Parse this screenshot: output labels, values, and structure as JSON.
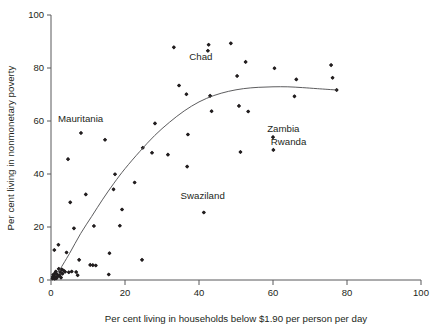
{
  "chart_data": {
    "type": "scatter",
    "title": "",
    "xlabel": "Per cent living in households below $1.90 per person per day",
    "ylabel": "Per cent living in nonmonetary poverty",
    "xlim": [
      0,
      100
    ],
    "ylim": [
      0,
      100
    ],
    "xticks": [
      0,
      20,
      40,
      60,
      80,
      100
    ],
    "yticks": [
      0,
      20,
      40,
      60,
      80,
      100
    ],
    "grid": false,
    "legend": "none",
    "marker_color": "#231f20",
    "curve_color": "#4a4a4c",
    "points": [
      [
        0.4,
        0.6
      ],
      [
        0.5,
        1.2
      ],
      [
        0.6,
        2.0
      ],
      [
        0.7,
        0.8
      ],
      [
        0.8,
        1.6
      ],
      [
        0.9,
        11.3
      ],
      [
        1.0,
        0.5
      ],
      [
        1.1,
        2.6
      ],
      [
        1.2,
        1.0
      ],
      [
        1.3,
        3.2
      ],
      [
        1.5,
        0.7
      ],
      [
        1.6,
        2.2
      ],
      [
        1.8,
        1.3
      ],
      [
        2.0,
        13.3
      ],
      [
        2.1,
        4.2
      ],
      [
        2.3,
        1.8
      ],
      [
        2.5,
        3.0
      ],
      [
        2.7,
        0.9
      ],
      [
        2.9,
        4.0
      ],
      [
        3.1,
        2.4
      ],
      [
        3.4,
        3.6
      ],
      [
        3.8,
        3.1
      ],
      [
        4.2,
        10.4
      ],
      [
        4.6,
        45.6
      ],
      [
        4.8,
        2.9
      ],
      [
        5.2,
        29.3
      ],
      [
        5.6,
        3.2
      ],
      [
        6.2,
        19.5
      ],
      [
        6.8,
        3.0
      ],
      [
        7.2,
        1.8
      ],
      [
        7.6,
        7.6
      ],
      [
        8.1,
        55.5
      ],
      [
        9.4,
        32.3
      ],
      [
        10.6,
        5.7
      ],
      [
        11.3,
        5.6
      ],
      [
        11.6,
        20.4
      ],
      [
        12.1,
        5.5
      ],
      [
        14.6,
        52.9
      ],
      [
        15.6,
        2.1
      ],
      [
        15.8,
        10.1
      ],
      [
        16.9,
        34.2
      ],
      [
        17.3,
        39.9
      ],
      [
        18.6,
        20.5
      ],
      [
        19.2,
        26.6
      ],
      [
        22.6,
        36.8
      ],
      [
        24.6,
        7.6
      ],
      [
        24.8,
        49.9
      ],
      [
        27.3,
        48.0
      ],
      [
        28.1,
        59.1
      ],
      [
        31.6,
        47.3
      ],
      [
        33.2,
        87.8
      ],
      [
        34.6,
        73.4
      ],
      [
        36.6,
        70.1
      ],
      [
        36.8,
        42.8
      ],
      [
        37.0,
        54.9
      ],
      [
        41.3,
        25.5
      ],
      [
        42.4,
        86.5
      ],
      [
        42.6,
        88.8
      ],
      [
        43.0,
        69.5
      ],
      [
        43.4,
        63.7
      ],
      [
        48.6,
        89.3
      ],
      [
        50.3,
        77.0
      ],
      [
        50.8,
        65.7
      ],
      [
        51.2,
        48.3
      ],
      [
        52.6,
        82.3
      ],
      [
        53.3,
        63.6
      ],
      [
        60.0,
        53.9
      ],
      [
        60.1,
        49.1
      ],
      [
        60.4,
        79.9
      ],
      [
        65.8,
        69.3
      ],
      [
        66.3,
        75.7
      ],
      [
        75.7,
        81.1
      ],
      [
        76.1,
        76.3
      ],
      [
        77.2,
        71.7
      ]
    ],
    "trend_curve": [
      [
        2.0,
        3.0
      ],
      [
        5.0,
        10.0
      ],
      [
        8.0,
        17.5
      ],
      [
        11.0,
        24.0
      ],
      [
        14.0,
        30.5
      ],
      [
        17.0,
        36.5
      ],
      [
        20.0,
        42.0
      ],
      [
        24.0,
        48.5
      ],
      [
        28.0,
        54.5
      ],
      [
        32.0,
        59.5
      ],
      [
        36.0,
        63.8
      ],
      [
        40.0,
        67.2
      ],
      [
        44.0,
        69.6
      ],
      [
        48.0,
        71.2
      ],
      [
        52.0,
        72.2
      ],
      [
        56.0,
        72.7
      ],
      [
        60.0,
        72.9
      ],
      [
        64.0,
        72.9
      ],
      [
        68.0,
        72.6
      ],
      [
        72.0,
        72.2
      ],
      [
        77.2,
        71.7
      ]
    ],
    "annotations": [
      {
        "label": "Chad",
        "x": 40.5,
        "y": 83.0
      },
      {
        "label": "Mauritania",
        "x": 8.0,
        "y": 59.6
      },
      {
        "label": "Swaziland",
        "x": 41.0,
        "y": 30.5
      },
      {
        "label": "Zambia",
        "x": 62.8,
        "y": 55.8
      },
      {
        "label": "Rwanda",
        "x": 64.2,
        "y": 51.0
      }
    ]
  }
}
